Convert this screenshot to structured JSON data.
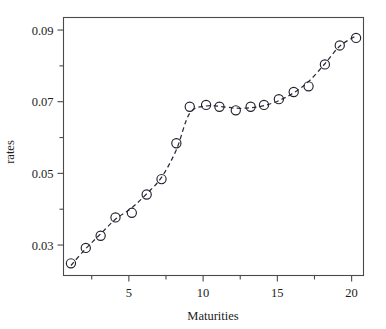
{
  "figure": {
    "width": 386,
    "height": 329,
    "background": "#ffffff",
    "foreground": "#1c1c1c"
  },
  "chart_data": {
    "type": "scatter",
    "title": "",
    "xlabel": "Maturities",
    "ylabel": "rates",
    "xlim": [
      0.6,
      20.8
    ],
    "ylim": [
      0.0215,
      0.0935
    ],
    "grid": false,
    "legend": null,
    "xticks": [
      5,
      10,
      15,
      20
    ],
    "xtick_labels": [
      "5",
      "10",
      "15",
      "20"
    ],
    "xticks_minor": [
      2.5,
      7.5,
      12.5,
      17.5
    ],
    "yticks": [
      0.03,
      0.05,
      0.07,
      0.09
    ],
    "ytick_labels": [
      "0.03",
      "0.05",
      "0.07",
      "0.09"
    ],
    "yticks_minor": [
      0.04,
      0.06,
      0.08
    ],
    "marker": "open-circle",
    "marker_size": 4.6,
    "marker_color": "#22222e",
    "line_style": "dashed",
    "line_color": "#2b2b3a",
    "x": [
      1.1,
      2.1,
      3.1,
      4.1,
      5.2,
      6.2,
      7.2,
      8.2,
      9.1,
      10.2,
      11.1,
      12.2,
      13.2,
      14.1,
      15.1,
      16.1,
      17.1,
      18.2,
      19.2,
      20.3
    ],
    "y": [
      0.0249,
      0.0292,
      0.0326,
      0.0377,
      0.039,
      0.0441,
      0.0484,
      0.0584,
      0.0686,
      0.0691,
      0.0686,
      0.0676,
      0.0686,
      0.0691,
      0.0707,
      0.0727,
      0.0743,
      0.0804,
      0.0857,
      0.0878
    ],
    "fit_x": [
      1.1,
      2.1,
      3.1,
      4.1,
      5.2,
      6.2,
      7.2,
      8.2,
      9.1,
      10.2,
      11.1,
      12.2,
      13.2,
      14.1,
      15.1,
      16.1,
      17.1,
      18.2,
      19.2,
      20.3
    ],
    "fit_y": [
      0.0243,
      0.029,
      0.0331,
      0.0372,
      0.0404,
      0.0443,
      0.0489,
      0.0566,
      0.0668,
      0.0688,
      0.0687,
      0.0682,
      0.0683,
      0.0689,
      0.0703,
      0.0725,
      0.0756,
      0.0806,
      0.0855,
      0.0884
    ]
  }
}
